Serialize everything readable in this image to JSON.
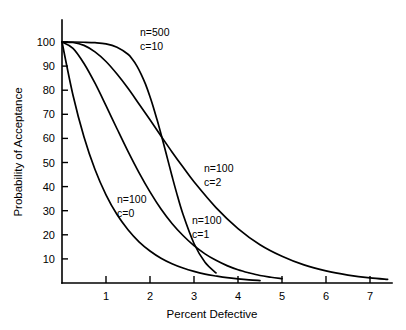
{
  "chart_data": {
    "type": "line",
    "title": "",
    "xlabel": "Percent Defective",
    "ylabel": "Probability of Acceptance",
    "xlim": [
      0,
      7.5
    ],
    "ylim": [
      0,
      105
    ],
    "xticks": [
      1,
      2,
      3,
      4,
      5,
      6,
      7
    ],
    "yticks": [
      10,
      20,
      30,
      40,
      50,
      60,
      70,
      80,
      90,
      100
    ],
    "grid": false,
    "legend_position": "inline-annotations",
    "series": [
      {
        "name": "n=100 c=0",
        "label_line1": "n=100",
        "label_line2": "c=0",
        "x": [
          0,
          0.25,
          0.5,
          0.75,
          1,
          1.25,
          1.5,
          1.75,
          2,
          2.25,
          2.5,
          2.75,
          3,
          3.25,
          3.5,
          3.75,
          4,
          4.25,
          4.5
        ],
        "y": [
          100,
          77.9,
          60.6,
          47.1,
          36.6,
          28.4,
          22.1,
          17.1,
          13.3,
          10.3,
          8.0,
          6.2,
          4.8,
          3.7,
          2.9,
          2.2,
          1.7,
          1.3,
          1.0
        ]
      },
      {
        "name": "n=100 c=1",
        "label_line1": "n=100",
        "label_line2": "c=1",
        "x": [
          0,
          0.25,
          0.5,
          0.75,
          1,
          1.25,
          1.5,
          1.75,
          2,
          2.25,
          2.5,
          2.75,
          3,
          3.25,
          3.5,
          3.75,
          4,
          4.25,
          4.5,
          4.75,
          5
        ],
        "y": [
          100,
          97.4,
          91.1,
          82.9,
          73.6,
          64.0,
          54.6,
          45.8,
          37.8,
          30.7,
          24.7,
          19.7,
          15.5,
          12.1,
          9.4,
          7.2,
          5.5,
          4.2,
          3.1,
          2.4,
          1.8
        ]
      },
      {
        "name": "n=100 c=2",
        "label_line1": "n=100",
        "label_line2": "c=2",
        "x": [
          0,
          0.25,
          0.5,
          0.75,
          1,
          1.25,
          1.5,
          1.75,
          2,
          2.25,
          2.5,
          2.75,
          3,
          3.5,
          4,
          4.5,
          5,
          5.5,
          6,
          6.5,
          7,
          7.4
        ],
        "y": [
          100,
          99.8,
          98.6,
          95.9,
          91.9,
          86.7,
          80.8,
          74.3,
          67.7,
          61.0,
          54.4,
          48.1,
          42.0,
          31.3,
          22.6,
          15.9,
          11.1,
          7.5,
          5.0,
          3.3,
          2.1,
          1.5
        ]
      },
      {
        "name": "n=500 c=10",
        "label_line1": "n=500",
        "label_line2": "c=10",
        "x": [
          0,
          0.25,
          0.5,
          0.75,
          1,
          1.25,
          1.5,
          1.6,
          1.7,
          1.8,
          1.9,
          2,
          2.05,
          2.1,
          2.15,
          2.2,
          2.3,
          2.4,
          2.5,
          2.6,
          2.75,
          3,
          3.25,
          3.5
        ],
        "y": [
          100,
          100,
          99.9,
          99.7,
          99.2,
          97.8,
          94.9,
          92.8,
          90.1,
          86.6,
          82.4,
          77.3,
          74.5,
          71.5,
          68.4,
          65.2,
          58.4,
          51.4,
          44.4,
          37.7,
          28.5,
          16.4,
          8.6,
          4.2
        ]
      }
    ],
    "annotations": [
      {
        "id": "ann-n500-c10",
        "line1": "n=500",
        "line2": "c=10",
        "x_px": 140,
        "y_px": 36
      },
      {
        "id": "ann-n100-c2",
        "line1": "n=100",
        "line2": "c=2",
        "x_px": 204,
        "y_px": 172
      },
      {
        "id": "ann-n100-c0",
        "line1": "n=100",
        "line2": "c=0",
        "x_px": 117,
        "y_px": 203
      },
      {
        "id": "ann-n100-c1",
        "line1": "n=100",
        "line2": "c=1",
        "x_px": 192,
        "y_px": 224
      }
    ]
  },
  "colors": {
    "axis": "#000000",
    "curve": "#000000",
    "background": "#ffffff"
  }
}
